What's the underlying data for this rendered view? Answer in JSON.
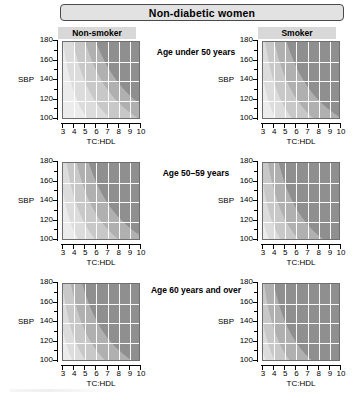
{
  "banner": {
    "title": "Non-diabetic women"
  },
  "columns": [
    {
      "key": "non_smoker",
      "label": "Non-smoker"
    },
    {
      "key": "smoker",
      "label": "Smoker"
    }
  ],
  "rows": [
    {
      "key": "under50",
      "label": "Age under 50 years"
    },
    {
      "key": "age50_59",
      "label": "Age  50–59 years"
    },
    {
      "key": "age60plus",
      "label": "Age 60 years and over"
    }
  ],
  "axes": {
    "y": {
      "title": "SBP",
      "ticks": [
        100,
        120,
        140,
        160,
        180
      ],
      "minor_ticks": [
        110,
        130,
        150,
        170
      ],
      "min": 100,
      "max": 180
    },
    "x": {
      "title": "TC:HDL",
      "ticks": [
        3,
        4,
        5,
        6,
        7,
        8,
        9,
        10
      ],
      "min": 3,
      "max": 10
    }
  },
  "risk_colors": {
    "lowest": "#ececec",
    "low": "#dcdcdc",
    "moderate": "#c8c8c8",
    "high": "#b0b0b0",
    "highest": "#8f8f8f",
    "gridline": "#ffffff",
    "plot_border": "#6f6f6f",
    "banner_fill": "#e2e2e2",
    "banner_border": "#4a4a4a",
    "colhead_fill": "#d8d8d8"
  },
  "chart_data": {
    "type": "heatmap",
    "title": "Non-diabetic women",
    "xlabel": "TC:HDL",
    "ylabel": "SBP",
    "xlim": [
      3,
      10
    ],
    "ylim": [
      100,
      180
    ],
    "grid": true,
    "legend_position": "none",
    "panels": [
      {
        "row": "Age under 50 years",
        "column": "Non-smoker",
        "bands": [
          {
            "name": "lowest",
            "color": "#ececec",
            "approx_share_pct": 46
          },
          {
            "name": "low",
            "color": "#dcdcdc",
            "approx_share_pct": 30
          },
          {
            "name": "moderate",
            "color": "#c8c8c8",
            "approx_share_pct": 18
          },
          {
            "name": "high",
            "color": "#b0b0b0",
            "approx_share_pct": 5
          },
          {
            "name": "highest",
            "color": "#8f8f8f",
            "approx_share_pct": 1
          }
        ]
      },
      {
        "row": "Age under 50 years",
        "column": "Smoker",
        "bands": [
          {
            "name": "lowest",
            "color": "#ececec",
            "approx_share_pct": 26
          },
          {
            "name": "low",
            "color": "#dcdcdc",
            "approx_share_pct": 27
          },
          {
            "name": "moderate",
            "color": "#c8c8c8",
            "approx_share_pct": 27
          },
          {
            "name": "high",
            "color": "#b0b0b0",
            "approx_share_pct": 16
          },
          {
            "name": "highest",
            "color": "#8f8f8f",
            "approx_share_pct": 4
          }
        ]
      },
      {
        "row": "Age  50–59 years",
        "column": "Non-smoker",
        "bands": [
          {
            "name": "lowest",
            "color": "#ececec",
            "approx_share_pct": 30
          },
          {
            "name": "low",
            "color": "#dcdcdc",
            "approx_share_pct": 28
          },
          {
            "name": "moderate",
            "color": "#c8c8c8",
            "approx_share_pct": 26
          },
          {
            "name": "high",
            "color": "#b0b0b0",
            "approx_share_pct": 13
          },
          {
            "name": "highest",
            "color": "#8f8f8f",
            "approx_share_pct": 3
          }
        ]
      },
      {
        "row": "Age  50–59 years",
        "column": "Smoker",
        "bands": [
          {
            "name": "lowest",
            "color": "#ececec",
            "approx_share_pct": 12
          },
          {
            "name": "low",
            "color": "#dcdcdc",
            "approx_share_pct": 18
          },
          {
            "name": "moderate",
            "color": "#c8c8c8",
            "approx_share_pct": 28
          },
          {
            "name": "high",
            "color": "#b0b0b0",
            "approx_share_pct": 30
          },
          {
            "name": "highest",
            "color": "#8f8f8f",
            "approx_share_pct": 12
          }
        ]
      },
      {
        "row": "Age 60 years and over",
        "column": "Non-smoker",
        "bands": [
          {
            "name": "lowest",
            "color": "#ececec",
            "approx_share_pct": 18
          },
          {
            "name": "low",
            "color": "#dcdcdc",
            "approx_share_pct": 22
          },
          {
            "name": "moderate",
            "color": "#c8c8c8",
            "approx_share_pct": 30
          },
          {
            "name": "high",
            "color": "#b0b0b0",
            "approx_share_pct": 22
          },
          {
            "name": "highest",
            "color": "#8f8f8f",
            "approx_share_pct": 8
          }
        ]
      },
      {
        "row": "Age 60 years and over",
        "column": "Smoker",
        "bands": [
          {
            "name": "lowest",
            "color": "#ececec",
            "approx_share_pct": 7
          },
          {
            "name": "low",
            "color": "#dcdcdc",
            "approx_share_pct": 13
          },
          {
            "name": "moderate",
            "color": "#c8c8c8",
            "approx_share_pct": 25
          },
          {
            "name": "high",
            "color": "#b0b0b0",
            "approx_share_pct": 33
          },
          {
            "name": "highest",
            "color": "#8f8f8f",
            "approx_share_pct": 22
          }
        ]
      }
    ]
  }
}
